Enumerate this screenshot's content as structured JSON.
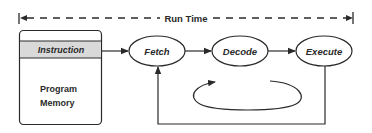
{
  "diagram": {
    "timeline": {
      "label": "Run Time"
    },
    "memory": {
      "row_label": "Instruction",
      "box_label_line1": "Program",
      "box_label_line2": "Memory"
    },
    "stages": [
      {
        "label": "Fetch"
      },
      {
        "label": "Decode"
      },
      {
        "label": "Execute"
      }
    ],
    "colors": {
      "stroke": "#2a2a2a",
      "instruction_band": "#d9d9d9",
      "background": "#ffffff"
    }
  }
}
